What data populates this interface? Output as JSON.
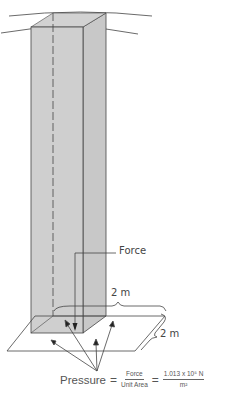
{
  "diagram": {
    "labels": {
      "force": "Force",
      "width_dimension": "2 m",
      "depth_dimension": "2 m"
    },
    "formula": {
      "lhs": "Pressure",
      "equals1": "=",
      "frac1_numerator": "Force",
      "frac1_denominator": "Unit Area",
      "equals2": "=",
      "frac2_numerator": "1.013 x 10⁵ N",
      "frac2_denominator": "m²"
    },
    "colors": {
      "column_fill": "#cdcdcd",
      "line": "#444444",
      "background": "#ffffff"
    }
  }
}
